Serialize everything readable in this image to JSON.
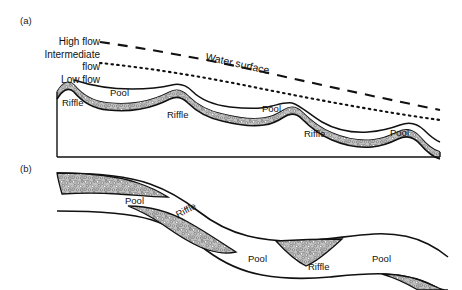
{
  "figure": {
    "background_color": "#ffffff",
    "line_color": "#111111",
    "gravel_fill_color": "#b0b0b0",
    "gravel_dot_color": "#4a4a4a"
  },
  "panels": [
    {
      "tag": "(a)",
      "view": "longitudinal-profile",
      "flow_lines": [
        {
          "name": "high-flow",
          "label": "High flow",
          "style": "dashed"
        },
        {
          "name": "intermediate-flow",
          "label_line1": "Intermediate",
          "label_line2": "flow",
          "style": "dotted"
        },
        {
          "name": "low-flow",
          "label": "Low flow",
          "style": "solid"
        }
      ],
      "annotations": [
        {
          "name": "water-surface",
          "label": "Water surface"
        }
      ],
      "bed_features": [
        {
          "name": "riffle",
          "label": "Riffle"
        },
        {
          "name": "pool",
          "label": "Pool"
        },
        {
          "name": "riffle",
          "label": "Riffle"
        },
        {
          "name": "pool",
          "label": "Pool"
        },
        {
          "name": "riffle",
          "label": "Riffle"
        },
        {
          "name": "pool",
          "label": "Pool"
        }
      ]
    },
    {
      "tag": "(b)",
      "view": "plan-view",
      "bed_features": [
        {
          "name": "pool",
          "label": "Pool"
        },
        {
          "name": "riffle",
          "label": "Riffle"
        },
        {
          "name": "pool",
          "label": "Pool"
        },
        {
          "name": "riffle",
          "label": "Riffle"
        },
        {
          "name": "pool",
          "label": "Pool"
        }
      ]
    }
  ],
  "labels": {
    "panel_a_tag": "(a)",
    "panel_b_tag": "(b)",
    "high_flow": "High flow",
    "intermediate_flow_line1": "Intermediate",
    "intermediate_flow_line2": "flow",
    "low_flow": "Low flow",
    "water_surface": "Water surface",
    "a_riffle_1": "Riffle",
    "a_pool_1": "Pool",
    "a_riffle_2": "Riffle",
    "a_pool_2": "Pool",
    "a_riffle_3": "Riffle",
    "a_pool_3": "Pool",
    "b_pool_1": "Pool",
    "b_riffle_1": "Riffle",
    "b_pool_2": "Pool",
    "b_riffle_2": "Riffle",
    "b_pool_3": "Pool"
  }
}
